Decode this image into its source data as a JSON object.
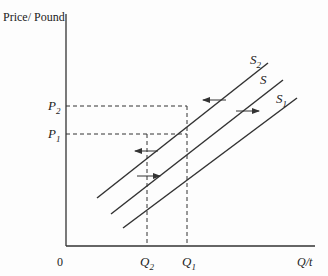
{
  "diagram": {
    "y_axis_label": "Price/ Pound",
    "x_axis_label": "Q/t",
    "origin_label": "0",
    "price_levels": [
      {
        "id": "P2",
        "main": "P",
        "sub": "2"
      },
      {
        "id": "P1",
        "main": "P",
        "sub": "1"
      }
    ],
    "quantity_levels": [
      {
        "id": "Q2",
        "main": "Q",
        "sub": "2"
      },
      {
        "id": "Q1",
        "main": "Q",
        "sub": "1"
      }
    ],
    "curves": [
      {
        "id": "S2",
        "main": "S",
        "sub": "2",
        "description": "supply shifted left"
      },
      {
        "id": "S",
        "main": "S",
        "sub": "",
        "description": "original supply"
      },
      {
        "id": "S1",
        "main": "S",
        "sub": "1",
        "description": "supply shifted right"
      }
    ],
    "arrows": [
      {
        "direction": "left",
        "between": [
          "S2",
          "S"
        ],
        "position": "upper"
      },
      {
        "direction": "right",
        "between": [
          "S",
          "S1"
        ],
        "position": "upper"
      },
      {
        "direction": "left",
        "between": [
          "S2",
          "S"
        ],
        "position": "lower"
      },
      {
        "direction": "right",
        "between": [
          "S",
          "S1"
        ],
        "position": "lower"
      }
    ],
    "colors": {
      "line": "#333333",
      "background": "#fdfdfd"
    }
  }
}
